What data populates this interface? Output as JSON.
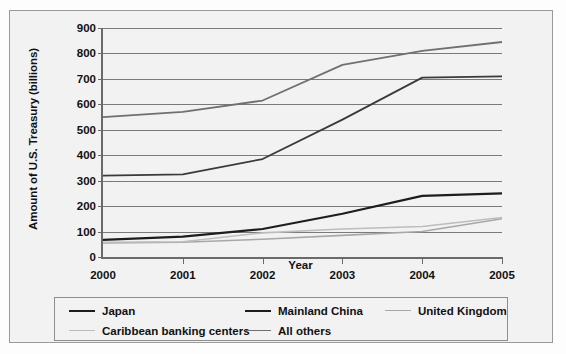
{
  "chart_data": {
    "type": "line",
    "title": "",
    "xlabel": "Year",
    "ylabel": "Amount of U.S. Treasury (billions)",
    "categories": [
      "2000",
      "2001",
      "2002",
      "2003",
      "2004",
      "2005"
    ],
    "x": [
      2000,
      2001,
      2002,
      2003,
      2004,
      2005
    ],
    "ylim": [
      0,
      900
    ],
    "xlim": [
      2000,
      2005
    ],
    "yticks": [
      0,
      100,
      200,
      300,
      400,
      500,
      600,
      700,
      800,
      900
    ],
    "grid": true,
    "legend_position": "bottom",
    "series": [
      {
        "name": "Japan",
        "color": "#3a3a3a",
        "width": 1.8,
        "values": [
          320,
          325,
          385,
          540,
          705,
          710
        ]
      },
      {
        "name": "Mainland China",
        "color": "#1d1d1d",
        "width": 2.2,
        "values": [
          67,
          80,
          110,
          170,
          240,
          250
        ]
      },
      {
        "name": "United Kingdom",
        "color": "#a8a8a8",
        "width": 1.6,
        "values": [
          55,
          58,
          70,
          85,
          100,
          150
        ]
      },
      {
        "name": "Caribbean banking centers",
        "color": "#bdbdbd",
        "width": 1.6,
        "values": [
          58,
          60,
          95,
          110,
          120,
          155
        ]
      },
      {
        "name": "All others",
        "color": "#707070",
        "width": 1.8,
        "values": [
          550,
          570,
          615,
          755,
          810,
          845
        ]
      }
    ]
  },
  "legend": {
    "entries": [
      {
        "label": "Japan",
        "color": "#1d1d1d",
        "width": 2.4
      },
      {
        "label": "Mainland China",
        "color": "#1d1d1d",
        "width": 2.4
      },
      {
        "label": "United Kingdom",
        "color": "#a8a8a8",
        "width": 1.6
      },
      {
        "label": "Caribbean banking centers",
        "color": "#bdbdbd",
        "width": 1.6
      },
      {
        "label": "All others",
        "color": "#707070",
        "width": 1.8
      }
    ]
  }
}
